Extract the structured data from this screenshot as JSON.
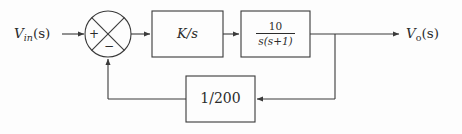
{
  "diagram": {
    "type": "control-system-block-diagram",
    "background_color": "#fdfdfd",
    "line_color": "#3a3a3a",
    "text_color": "#2b2b2b",
    "input": {
      "label_main": "V",
      "label_sub": "in",
      "label_args": "(s)",
      "full": "V_in(s)"
    },
    "output": {
      "label_main": "V",
      "label_sub": "o",
      "label_args": "(s)",
      "full": "V_o(s)"
    },
    "summing_junction": {
      "name": "summing-junction",
      "shape": "circle-with-x-cross",
      "input_sign": "+",
      "feedback_sign": "−"
    },
    "blocks": [
      {
        "name": "gain-block",
        "text": "K/s",
        "style": "inline-slash"
      },
      {
        "name": "plant-block",
        "numerator": "10",
        "denominator_var": "s",
        "denominator_factor": "(s+1)",
        "text": "10/(s(s+1))",
        "style": "stacked-fraction"
      },
      {
        "name": "feedback-block",
        "text": "1/200",
        "style": "inline-slash"
      }
    ],
    "signal_flow": [
      "V_in(s) -> summing junction (+)",
      "summing junction -> K/s",
      "K/s -> 10/(s(s+1))",
      "10/(s(s+1)) -> takeoff point -> V_o(s)",
      "takeoff point -> 1/200 (feedback)",
      "1/200 -> summing junction (−)"
    ]
  }
}
